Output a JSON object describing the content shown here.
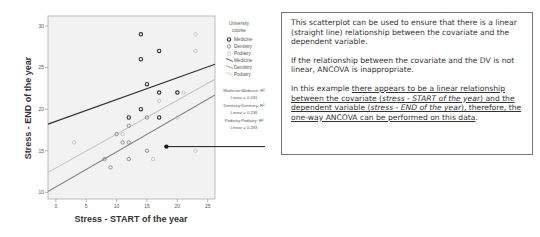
{
  "chart_data": {
    "type": "scatter",
    "title": "",
    "xlabel": "Stress - START of the year",
    "ylabel": "Stress - END of the year",
    "xlim": [
      -1.3,
      26.2
    ],
    "ylim": [
      9.2,
      31.2
    ],
    "x_ticks": [
      0,
      5,
      10,
      15,
      20,
      25
    ],
    "y_ticks": [
      10,
      15,
      20,
      25,
      30
    ],
    "grid": false,
    "legend_position": "right",
    "legend_title": "University course",
    "series": [
      {
        "name": "Medicine",
        "color": "#333333",
        "points": [
          [
            14,
            29
          ],
          [
            17,
            27
          ],
          [
            14,
            26
          ],
          [
            15,
            23
          ],
          [
            17,
            22
          ],
          [
            20,
            22
          ],
          [
            14,
            20
          ],
          [
            12,
            19
          ],
          [
            17,
            19
          ]
        ],
        "fit_line": {
          "x": [
            -1.3,
            26.2
          ],
          "y": [
            18.2,
            25.4
          ]
        },
        "fit_label": "Medicine;Medicine: R²",
        "r2_label": "Linear = 0.031"
      },
      {
        "name": "Dentistry",
        "color": "#888888",
        "points": [
          [
            10,
            17
          ],
          [
            11,
            16
          ],
          [
            12,
            16
          ],
          [
            12,
            14
          ],
          [
            8,
            14
          ],
          [
            9,
            13
          ],
          [
            15,
            15
          ],
          [
            15,
            19
          ],
          [
            12,
            18
          ]
        ],
        "fit_line": {
          "x": [
            -1.3,
            26.2
          ],
          "y": [
            10.1,
            21.7
          ]
        },
        "fit_label": "Dentistry;Dentistry: R²",
        "r2_label": "Linear = 0.236"
      },
      {
        "name": "Podiatry",
        "color": "#c4c4c4",
        "points": [
          [
            3,
            16
          ],
          [
            11,
            17
          ],
          [
            17,
            21
          ],
          [
            21,
            22
          ],
          [
            23,
            29
          ],
          [
            23,
            27
          ],
          [
            16,
            14
          ],
          [
            23,
            15
          ],
          [
            20,
            19
          ]
        ],
        "fit_line": {
          "x": [
            -1.3,
            26.2
          ],
          "y": [
            12.4,
            23.6
          ]
        },
        "fit_label": "Podiatry;Podiatry: R²",
        "r2_label": "Linear = 0.293"
      }
    ],
    "annotation_marker": {
      "x": 18.2,
      "y": 15.5
    }
  },
  "legend": {
    "title_line1": "University",
    "title_line2": "course",
    "marker_items": [
      "Medicine",
      "Dentistry",
      "Podiatry"
    ],
    "line_items": [
      "Medicine",
      "Dentistry",
      "Podiatry"
    ]
  },
  "fit_labels": [
    {
      "line1": "Medicine;Medicine: R²",
      "line2": "Linear = 0.031"
    },
    {
      "line1": "Dentistry;Dentistry: R²",
      "line2": "Linear = 0.236"
    },
    {
      "line1": "Podiatry;Podiatry: R²",
      "line2": "Linear = 0.293"
    }
  ],
  "explanation": {
    "para1": "This scatterplot can be used to ensure that there is a linear (straight line) relationship between the covariate and the dependent variable.",
    "para2": "If the relationship between the covariate and the DV is not linear, ANCOVA is inappropriate.",
    "para3_intro": "In this example ",
    "para3_u1": "there appears to be a linear relationship between the covariate (",
    "para3_i1": "stress - START of the year",
    "para3_u2": ") and the dependent variable (",
    "para3_i2": "stress - END of the year",
    "para3_u3": "), therefore, the one-way ANCOVA can be performed on this data",
    "para3_end": "."
  }
}
